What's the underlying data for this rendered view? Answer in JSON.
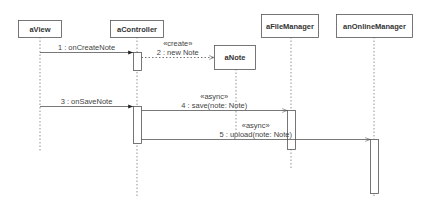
{
  "diagram": {
    "type": "sequence",
    "colors": {
      "stroke": "#555555",
      "lifeline": "#777777",
      "text": "#333333",
      "background": "#ffffff"
    },
    "participants": [
      {
        "id": "aView",
        "label": "aView",
        "box": [
          18,
          20,
          43,
          17
        ],
        "lifeline_x": 40,
        "lifeline_end": 152
      },
      {
        "id": "aController",
        "label": "aController",
        "box": [
          110,
          20,
          53,
          17
        ],
        "lifeline_x": 137,
        "lifeline_end": 198
      },
      {
        "id": "aNote",
        "label": "aNote",
        "box": [
          214,
          45,
          41,
          24
        ],
        "lifeline_x": 236,
        "lifeline_end": 133
      },
      {
        "id": "aFileManager",
        "label": "aFileManager",
        "box": [
          261,
          14,
          57,
          23
        ],
        "lifeline_x": 291,
        "lifeline_end": 170
      },
      {
        "id": "anOnlineManager",
        "label": "anOnlineManager",
        "box": [
          336,
          14,
          76,
          23
        ],
        "lifeline_x": 374,
        "lifeline_end": 198
      }
    ],
    "activations": [
      {
        "participant": "aController",
        "x": 133,
        "y": 52,
        "w": 8,
        "h": 18
      },
      {
        "participant": "aController",
        "x": 133,
        "y": 106,
        "w": 8,
        "h": 37
      },
      {
        "participant": "aFileManager",
        "x": 287,
        "y": 110,
        "w": 8,
        "h": 39
      },
      {
        "participant": "anOnlineManager",
        "x": 370,
        "y": 139,
        "w": 8,
        "h": 54
      }
    ],
    "messages": [
      {
        "number": "1",
        "text": "1 : onCreateNote",
        "stereotype": "",
        "from": "aView",
        "to": "aController",
        "y": 52,
        "style": "sync"
      },
      {
        "number": "2",
        "text": "2 : new Note",
        "stereotype": "«create»",
        "from": "aController",
        "to": "aNote",
        "y": 57,
        "style": "create"
      },
      {
        "number": "3",
        "text": "3 : onSaveNote",
        "stereotype": "",
        "from": "aView",
        "to": "aController",
        "y": 106,
        "style": "sync"
      },
      {
        "number": "4",
        "text": "4 : save(note: Note)",
        "stereotype": "«async»",
        "from": "aController",
        "to": "aFileManager",
        "y": 110,
        "style": "async"
      },
      {
        "number": "5",
        "text": "5 : upload(note: Note)",
        "stereotype": "«async»",
        "from": "aController",
        "to": "anOnlineManager",
        "y": 139,
        "style": "async"
      }
    ]
  }
}
